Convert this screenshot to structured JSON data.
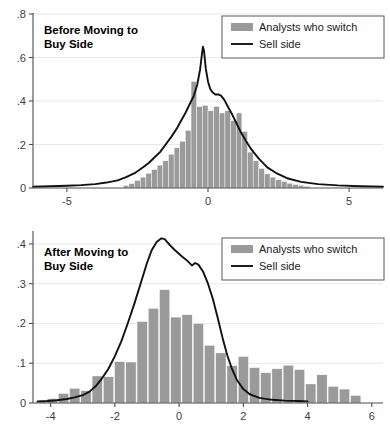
{
  "chart_data": [
    {
      "type": "bar",
      "id": "before-moving-to-buy-side",
      "title": "Before Moving to\nBuy Side",
      "title_line1": "Before Moving to",
      "title_line2": "Buy Side",
      "xlabel": "",
      "ylabel": "",
      "xlim": [
        -6.2,
        6.2
      ],
      "ylim": [
        0,
        0.8
      ],
      "xticks": [
        -5,
        0,
        5
      ],
      "xticklabels": [
        "-5",
        "0",
        "5"
      ],
      "yticks": [
        0,
        0.2,
        0.4,
        0.6,
        0.8
      ],
      "yticklabels": [
        "0",
        ".2",
        ".4",
        ".6",
        ".8"
      ],
      "grid": true,
      "legend_position": "top-right",
      "legend": [
        {
          "label": "Analysts who switch",
          "marker": "bar",
          "color": "#9a9a9a"
        },
        {
          "label": "Sell side",
          "marker": "line",
          "color": "#111111"
        }
      ],
      "bar_width": 0.2,
      "categories": [
        -2.9,
        -2.7,
        -2.5,
        -2.3,
        -2.1,
        -1.9,
        -1.7,
        -1.5,
        -1.3,
        -1.1,
        -0.9,
        -0.7,
        -0.5,
        -0.3,
        -0.1,
        0.1,
        0.3,
        0.5,
        0.7,
        0.9,
        1.1,
        1.3,
        1.5,
        1.7,
        1.9,
        2.1,
        2.3,
        2.5,
        2.7,
        2.9,
        3.1,
        3.3,
        3.5
      ],
      "values": [
        0.012,
        0.02,
        0.035,
        0.05,
        0.068,
        0.085,
        0.105,
        0.125,
        0.155,
        0.185,
        0.215,
        0.265,
        0.49,
        0.375,
        0.38,
        0.355,
        0.375,
        0.345,
        0.355,
        0.31,
        0.345,
        0.26,
        0.165,
        0.125,
        0.09,
        0.065,
        0.05,
        0.038,
        0.03,
        0.022,
        0.016,
        0.012,
        0.008
      ],
      "series": [
        {
          "name": "Sell side",
          "type": "line",
          "x": [
            -6.2,
            -5.6,
            -5.0,
            -4.5,
            -4.0,
            -3.6,
            -3.2,
            -2.9,
            -2.6,
            -2.3,
            -2.1,
            -1.9,
            -1.7,
            -1.5,
            -1.3,
            -1.1,
            -0.95,
            -0.8,
            -0.65,
            -0.5,
            -0.38,
            -0.28,
            -0.22,
            -0.18,
            -0.14,
            -0.08,
            0.0,
            0.08,
            0.16,
            0.26,
            0.36,
            0.46,
            0.58,
            0.7,
            0.85,
            1.0,
            1.15,
            1.35,
            1.55,
            1.8,
            2.1,
            2.4,
            2.8,
            3.3,
            3.9,
            4.6,
            5.4,
            6.2
          ],
          "y": [
            0.006,
            0.008,
            0.01,
            0.013,
            0.018,
            0.025,
            0.035,
            0.05,
            0.068,
            0.095,
            0.115,
            0.14,
            0.165,
            0.2,
            0.235,
            0.275,
            0.31,
            0.345,
            0.385,
            0.425,
            0.475,
            0.545,
            0.61,
            0.65,
            0.63,
            0.55,
            0.49,
            0.455,
            0.44,
            0.43,
            0.43,
            0.425,
            0.405,
            0.375,
            0.34,
            0.3,
            0.26,
            0.215,
            0.175,
            0.135,
            0.095,
            0.07,
            0.045,
            0.028,
            0.018,
            0.012,
            0.008,
            0.006
          ]
        }
      ]
    },
    {
      "type": "bar",
      "id": "after-moving-to-buy-side",
      "title": "After Moving to\nBuy Side",
      "title_line1": "After Moving to",
      "title_line2": "Buy Side",
      "xlabel": "",
      "ylabel": "",
      "xlim": [
        -4.55,
        6.35
      ],
      "ylim": [
        0,
        0.43
      ],
      "xticks": [
        -4,
        -2,
        0,
        2,
        4,
        6
      ],
      "xticklabels": [
        "-4",
        "-2",
        "0",
        "2",
        "4",
        "6"
      ],
      "yticks": [
        0,
        0.1,
        0.2,
        0.3,
        0.4
      ],
      "yticklabels": [
        "0",
        ".1",
        ".2",
        ".3",
        ".4"
      ],
      "grid": true,
      "legend_position": "top-right",
      "legend": [
        {
          "label": "Analysts who switch",
          "marker": "bar",
          "color": "#9a9a9a"
        },
        {
          "label": "Sell side",
          "marker": "line",
          "color": "#111111"
        }
      ],
      "bar_width": 0.32,
      "categories": [
        -4.3,
        -3.95,
        -3.6,
        -3.25,
        -2.9,
        -2.55,
        -2.2,
        -1.85,
        -1.5,
        -1.15,
        -0.8,
        -0.45,
        -0.1,
        0.25,
        0.6,
        0.95,
        1.3,
        1.65,
        2.0,
        2.35,
        2.7,
        3.05,
        3.4,
        3.75,
        4.1,
        4.45,
        4.8,
        5.15,
        5.5
      ],
      "values": [
        0.006,
        0.011,
        0.024,
        0.037,
        0.031,
        0.068,
        0.066,
        0.104,
        0.103,
        0.205,
        0.238,
        0.285,
        0.216,
        0.222,
        0.2,
        0.145,
        0.126,
        0.094,
        0.117,
        0.089,
        0.076,
        0.086,
        0.095,
        0.084,
        0.048,
        0.071,
        0.042,
        0.035,
        0.019
      ],
      "series": [
        {
          "name": "Sell side",
          "type": "line",
          "x": [
            -4.4,
            -4.1,
            -3.8,
            -3.5,
            -3.25,
            -3.0,
            -2.8,
            -2.6,
            -2.4,
            -2.2,
            -2.0,
            -1.8,
            -1.6,
            -1.4,
            -1.2,
            -1.0,
            -0.85,
            -0.7,
            -0.55,
            -0.45,
            -0.3,
            -0.1,
            0.1,
            0.25,
            0.4,
            0.5,
            0.6,
            0.75,
            0.9,
            1.05,
            1.2,
            1.35,
            1.5,
            1.65,
            1.8,
            2.0,
            2.2,
            2.5,
            2.9,
            3.3,
            3.7,
            4.0
          ],
          "y": [
            0.004,
            0.005,
            0.007,
            0.01,
            0.014,
            0.02,
            0.028,
            0.042,
            0.062,
            0.086,
            0.118,
            0.155,
            0.2,
            0.248,
            0.3,
            0.352,
            0.385,
            0.405,
            0.414,
            0.412,
            0.398,
            0.382,
            0.368,
            0.358,
            0.346,
            0.352,
            0.348,
            0.33,
            0.3,
            0.262,
            0.215,
            0.165,
            0.12,
            0.085,
            0.058,
            0.035,
            0.022,
            0.013,
            0.008,
            0.006,
            0.005,
            0.004
          ]
        }
      ]
    }
  ]
}
